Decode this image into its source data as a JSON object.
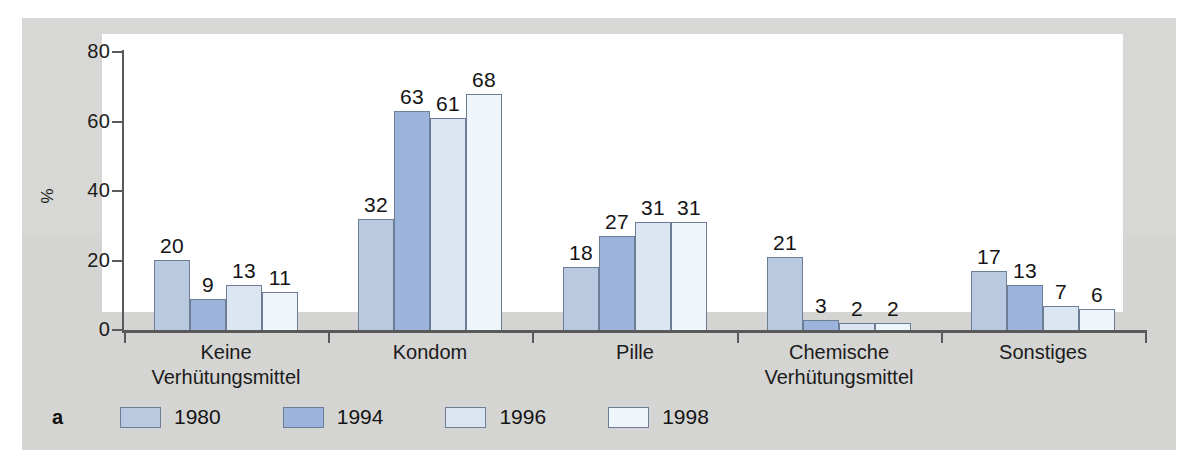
{
  "figure": {
    "panel_letter": "a",
    "background_color": "#d7d7d5",
    "plot_background_color": "#ffffff"
  },
  "chart_data": {
    "type": "bar",
    "title": "",
    "subtitle": "",
    "xlabel": "",
    "ylabel": "%",
    "ylim": [
      0,
      80
    ],
    "yticks": [
      0,
      20,
      40,
      60,
      80
    ],
    "grid": false,
    "legend_position": "bottom",
    "categories": [
      "Keine Verhütungsmittel",
      "Kondom",
      "Pille",
      "Chemische Verhütungsmittel",
      "Sonstiges"
    ],
    "category_lines": [
      [
        "Keine",
        "Verhütungsmittel"
      ],
      [
        "Kondom"
      ],
      [
        "Pille"
      ],
      [
        "Chemische",
        "Verhütungsmittel"
      ],
      [
        "Sonstiges"
      ]
    ],
    "series": [
      {
        "name": "1980",
        "color": "#b9c9e0",
        "values": [
          20,
          32,
          18,
          21,
          17
        ]
      },
      {
        "name": "1994",
        "color": "#9cb4dc",
        "values": [
          9,
          63,
          27,
          3,
          13
        ]
      },
      {
        "name": "1996",
        "color": "#dbe6f2",
        "values": [
          13,
          61,
          31,
          2,
          7
        ]
      },
      {
        "name": "1998",
        "color": "#eef5fb",
        "values": [
          11,
          68,
          31,
          2,
          6
        ]
      }
    ]
  },
  "legend": {
    "items": [
      {
        "label": "1980",
        "color": "#b9c9e0"
      },
      {
        "label": "1994",
        "color": "#9cb4dc"
      },
      {
        "label": "1996",
        "color": "#dbe6f2"
      },
      {
        "label": "1998",
        "color": "#eef5fb"
      }
    ]
  },
  "axis": {
    "y_tick_labels": [
      "0",
      "20",
      "40",
      "60",
      "80"
    ],
    "y_title": "%"
  }
}
